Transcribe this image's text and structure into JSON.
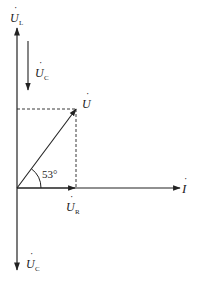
{
  "diagram": {
    "type": "phasor-diagram",
    "colors": {
      "line": "#222222",
      "background": "#ffffff"
    },
    "labels": {
      "UL": {
        "main": "U",
        "sub": "L"
      },
      "UC_top": {
        "main": "U",
        "sub": "C"
      },
      "U": {
        "main": "U",
        "sub": ""
      },
      "UR": {
        "main": "U",
        "sub": "R"
      },
      "I": {
        "main": "I",
        "sub": ""
      },
      "UC_bottom": {
        "main": "U",
        "sub": "C"
      }
    },
    "angle": "53°",
    "dot": "·"
  }
}
